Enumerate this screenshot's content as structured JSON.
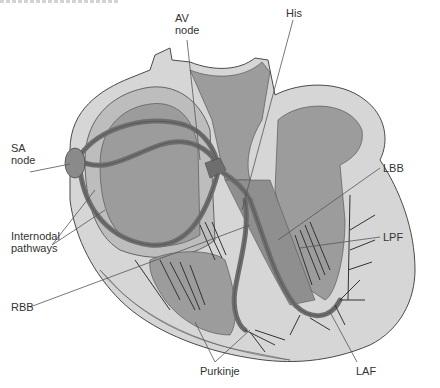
{
  "diagram": {
    "colors": {
      "outer_tissue": "#d6d6d6",
      "mid_tissue": "#bdbdbd",
      "chamber": "#9c9c9c",
      "conduction_path": "#6e6e6e",
      "outline": "#4a4a4a",
      "leader_line": "#555555",
      "label_text": "#333333"
    },
    "labels": {
      "av_node": "AV\nnode",
      "his": "His",
      "sa_node": "SA\nnode",
      "lbb": "LBB",
      "internodal": "Internodal\npathways",
      "lpf": "LPF",
      "rbb": "RBB",
      "purkinje": "Purkinje",
      "laf": "LAF"
    }
  }
}
